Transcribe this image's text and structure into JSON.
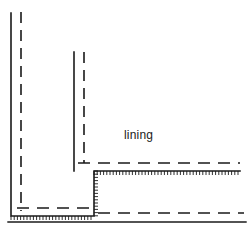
{
  "figure": {
    "type": "technical-line-drawing",
    "width": 252,
    "height": 241,
    "background_color": "#ffffff",
    "line_color": "#1a1a1a",
    "labels": [
      {
        "id": "lining",
        "text": "lining",
        "x": 124,
        "y": 139,
        "font_size": 12,
        "anchor": "start"
      }
    ],
    "geometry": {
      "solid_profile": {
        "description": "stepped solid outline of structure face with hatching",
        "points": "11,13 11,216 94,216 94,171 240,171",
        "stroke_width": 1.6
      },
      "solid_lower_boundary": {
        "description": "bottom ground solid line",
        "x1": 8,
        "y1": 222,
        "x2": 246,
        "y2": 222,
        "stroke_width": 1.4
      },
      "solid_inner_vertical": {
        "description": "inner vertical solid edge of step",
        "x1": 74,
        "y1": 52,
        "x2": 74,
        "y2": 171,
        "stroke_width": 1.6
      },
      "dashed_lines": [
        {
          "id": "dash-outer-vertical",
          "description": "dashed line parallel to outer left wall",
          "x1": 21,
          "y1": 12,
          "x2": 21,
          "y2": 211,
          "dash": "11 7"
        },
        {
          "id": "dash-inner-vertical",
          "description": "dashed line parallel to inner step wall",
          "x1": 84,
          "y1": 52,
          "x2": 84,
          "y2": 163,
          "dash": "11 7"
        },
        {
          "id": "dash-mid-horizontal",
          "description": "dashed line above step soffit toward right",
          "x1": 78,
          "y1": 163,
          "x2": 240,
          "y2": 163,
          "dash": "12 8"
        },
        {
          "id": "dash-lower-left-horizontal",
          "description": "dashed line above base slab on left bay",
          "x1": 17,
          "y1": 208,
          "x2": 90,
          "y2": 208,
          "dash": "12 8"
        },
        {
          "id": "dash-lower-right-horizontal",
          "description": "dashed line above ground line on right",
          "x1": 98,
          "y1": 213,
          "x2": 244,
          "y2": 213,
          "dash": "12 8"
        }
      ],
      "hatching": [
        {
          "id": "hatch-step-soffit",
          "description": "short tick hatching below step soffit running right",
          "orientation": "horizontal",
          "x_start": 94,
          "x_end": 240,
          "y": 171,
          "tick_length": 4,
          "tick_spacing": 3.2,
          "direction": "down"
        },
        {
          "id": "hatch-step-riser",
          "description": "short tick hatching right of step riser",
          "orientation": "vertical",
          "y_start": 171,
          "y_end": 216,
          "x": 94,
          "tick_length": 4,
          "tick_spacing": 3.2,
          "direction": "right"
        },
        {
          "id": "hatch-base-slab",
          "description": "short tick hatching below base slab on left bay",
          "orientation": "horizontal",
          "x_start": 11,
          "x_end": 94,
          "y": 216,
          "tick_length": 4,
          "tick_spacing": 3.2,
          "direction": "down"
        }
      ]
    }
  }
}
